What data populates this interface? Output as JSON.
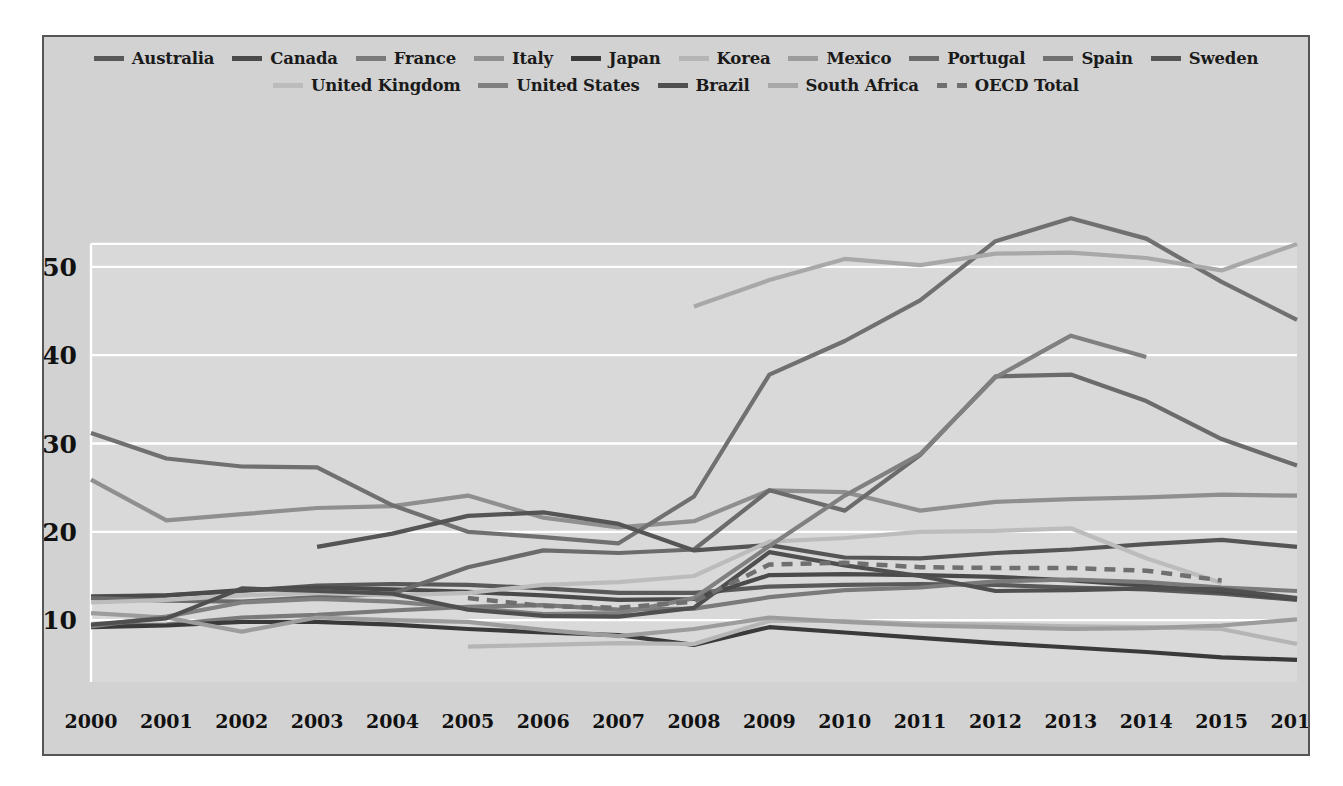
{
  "chart_data": {
    "type": "line",
    "title": "",
    "subtitle": "",
    "xlabel": "",
    "ylabel": "",
    "x": [
      2000,
      2001,
      2002,
      2003,
      2004,
      2005,
      2006,
      2007,
      2008,
      2009,
      2010,
      2011,
      2012,
      2013,
      2014,
      2015,
      2016
    ],
    "xtick_labels": [
      "2000",
      "2001",
      "2002",
      "2003",
      "2004",
      "2005",
      "2006",
      "2007",
      "2008",
      "2009",
      "2010",
      "2011",
      "2012",
      "2013",
      "2014",
      "2015",
      "2016"
    ],
    "ytick_labels": [
      "10",
      "20",
      "30",
      "40",
      "50"
    ],
    "yticks": [
      10,
      20,
      30,
      40,
      50
    ],
    "ylim": [
      3,
      57
    ],
    "xlim": [
      2000,
      2016
    ],
    "grid": "horizontal",
    "legend_position": "top",
    "series": [
      {
        "name": "Australia",
        "color": "#595959",
        "dash": false,
        "values": [
          12.7,
          12.8,
          13.3,
          13.9,
          14.1,
          14.0,
          13.6,
          13.1,
          13.1,
          13.8,
          14.0,
          14.1,
          14.0,
          13.7,
          13.5,
          13.0,
          12.3
        ]
      },
      {
        "name": "Canada",
        "color": "#4a4a4a",
        "dash": false,
        "values": [
          12.6,
          12.8,
          13.4,
          13.7,
          13.5,
          13.2,
          12.8,
          12.3,
          12.4,
          15.1,
          15.2,
          15.1,
          14.9,
          14.5,
          13.9,
          13.2,
          12.4
        ]
      },
      {
        "name": "France",
        "color": "#7a7a7a",
        "dash": false,
        "values": [
          9.4,
          9.5,
          10.3,
          10.6,
          11.1,
          11.5,
          11.7,
          11.2,
          11.3,
          12.6,
          13.4,
          13.7,
          14.4,
          14.6,
          14.3,
          13.7,
          13.3
        ]
      },
      {
        "name": "Italy",
        "color": "#8f8f8f",
        "dash": false,
        "values": [
          25.9,
          21.3,
          22.0,
          22.7,
          22.9,
          24.1,
          21.6,
          20.5,
          21.2,
          24.7,
          24.5,
          22.4,
          23.4,
          23.7,
          23.9,
          24.2,
          24.1
        ]
      },
      {
        "name": "Japan",
        "color": "#3a3a3a",
        "dash": false,
        "values": [
          9.2,
          9.4,
          9.8,
          9.8,
          9.5,
          9.0,
          8.6,
          8.3,
          7.2,
          9.2,
          8.6,
          8.0,
          7.4,
          6.9,
          6.4,
          5.8,
          5.5
        ]
      },
      {
        "name": "Korea",
        "color": "#b5b5b5",
        "dash": false,
        "values": [
          null,
          null,
          null,
          null,
          null,
          7.0,
          7.2,
          7.4,
          7.3,
          9.9,
          9.9,
          9.6,
          9.5,
          9.3,
          9.2,
          9.0,
          7.3
        ]
      },
      {
        "name": "Mexico",
        "color": "#9c9c9c",
        "dash": false,
        "values": [
          10.8,
          10.3,
          8.7,
          10.3,
          10.0,
          9.8,
          8.9,
          8.2,
          9.0,
          10.3,
          9.8,
          9.4,
          9.2,
          9.0,
          9.1,
          9.4,
          10.1
        ]
      },
      {
        "name": "Portugal",
        "color": "#6b6b6b",
        "dash": false,
        "values": [
          12.5,
          12.2,
          12.1,
          12.6,
          13.0,
          16.0,
          17.9,
          17.6,
          18.0,
          24.7,
          22.4,
          28.7,
          37.6,
          37.8,
          34.8,
          30.5,
          27.5
        ]
      },
      {
        "name": "Spain",
        "color": "#707070",
        "dash": false,
        "values": [
          31.2,
          28.3,
          27.4,
          27.3,
          23.0,
          20.0,
          19.4,
          18.7,
          24.0,
          37.8,
          41.6,
          46.2,
          52.9,
          55.5,
          53.2,
          48.3,
          44.0
        ]
      },
      {
        "name": "Sweden",
        "color": "#555555",
        "dash": false,
        "values": [
          null,
          null,
          null,
          18.3,
          19.8,
          21.8,
          22.2,
          20.9,
          17.9,
          18.5,
          17.1,
          17.0,
          17.6,
          18.0,
          18.6,
          19.1,
          18.3
        ]
      },
      {
        "name": "United Kingdom",
        "color": "#bcbcbc",
        "dash": false,
        "values": [
          12.0,
          12.3,
          12.8,
          13.1,
          12.8,
          13.1,
          14.0,
          14.3,
          15.0,
          18.9,
          19.3,
          20.0,
          20.1,
          20.4,
          17.0,
          14.2,
          null
        ]
      },
      {
        "name": "United States",
        "color": "#808080",
        "dash": false,
        "values": [
          9.3,
          10.4,
          12.0,
          12.4,
          12.1,
          11.4,
          10.7,
          10.8,
          12.5,
          18.4,
          24.1,
          28.8,
          37.5,
          42.2,
          39.8,
          null,
          null
        ]
      },
      {
        "name": "Brazil",
        "color": "#4f4f4f",
        "dash": false,
        "values": [
          9.5,
          10.2,
          13.6,
          13.3,
          13.0,
          11.2,
          10.5,
          10.4,
          11.4,
          17.7,
          16.2,
          15.0,
          13.3,
          13.4,
          13.6,
          13.5,
          12.5
        ]
      },
      {
        "name": "South Africa",
        "color": "#a8a8a8",
        "dash": false,
        "values": [
          null,
          null,
          null,
          null,
          null,
          null,
          null,
          null,
          45.5,
          48.5,
          50.9,
          50.2,
          51.5,
          51.6,
          51.0,
          49.6,
          52.6
        ]
      },
      {
        "name": "OECD Total",
        "color": "#6f6f6f",
        "dash": true,
        "values": [
          null,
          null,
          null,
          null,
          null,
          12.5,
          11.6,
          11.4,
          12.1,
          16.3,
          16.5,
          16.0,
          15.9,
          15.9,
          15.6,
          14.5,
          null
        ]
      }
    ]
  },
  "legend": {
    "row1": [
      "Australia",
      "Canada",
      "France",
      "Italy",
      "Japan",
      "Korea",
      "Mexico",
      "Portugal",
      "Spain",
      "Sweden"
    ],
    "row2": [
      "United Kingdom",
      "United States",
      "Brazil",
      "South Africa",
      "OECD Total"
    ]
  }
}
